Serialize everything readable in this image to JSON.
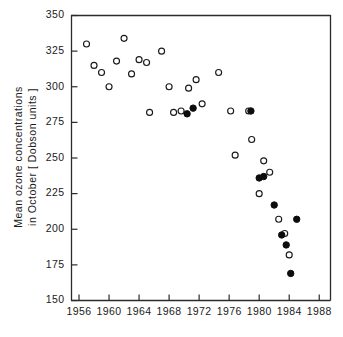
{
  "chart_data": {
    "type": "scatter",
    "title": "",
    "xlabel": "",
    "ylabel": "Mean ozone concentrations in October [ Dobson units ]",
    "ylabel_line1": "Mean ozone concentrations",
    "ylabel_line2": "in October [ Dobson units ]",
    "xlim": [
      1955,
      1989.5
    ],
    "ylim": [
      150,
      350
    ],
    "xticks": [
      1956,
      1960,
      1964,
      1968,
      1972,
      1976,
      1980,
      1984,
      1988
    ],
    "xtick_labels": [
      "1956",
      "1960",
      "1964",
      "1968",
      "1972",
      "1976",
      "1980",
      "1984",
      "1988"
    ],
    "yticks": [
      150,
      175,
      200,
      225,
      250,
      275,
      300,
      325,
      350
    ],
    "ytick_labels": [
      "150",
      "175",
      "200",
      "225",
      "250",
      "275",
      "300",
      "325",
      "350"
    ],
    "grid": false,
    "legend": "none",
    "marker_colors": {
      "open": "#ffffff",
      "filled": "#0d0d0d",
      "edge": "#1a1a1a"
    },
    "series": [
      {
        "name": "open-circles",
        "marker": "open-circle",
        "points": [
          {
            "x": 1957,
            "y": 330
          },
          {
            "x": 1958,
            "y": 315
          },
          {
            "x": 1959,
            "y": 310
          },
          {
            "x": 1960,
            "y": 300
          },
          {
            "x": 1961,
            "y": 318
          },
          {
            "x": 1962,
            "y": 334
          },
          {
            "x": 1963,
            "y": 309
          },
          {
            "x": 1964,
            "y": 319
          },
          {
            "x": 1965,
            "y": 317
          },
          {
            "x": 1965.4,
            "y": 282
          },
          {
            "x": 1967,
            "y": 325
          },
          {
            "x": 1968,
            "y": 300
          },
          {
            "x": 1968.6,
            "y": 282
          },
          {
            "x": 1969.6,
            "y": 283
          },
          {
            "x": 1970.6,
            "y": 299
          },
          {
            "x": 1971.6,
            "y": 305
          },
          {
            "x": 1972.4,
            "y": 288
          },
          {
            "x": 1974.6,
            "y": 310
          },
          {
            "x": 1976.2,
            "y": 283
          },
          {
            "x": 1976.8,
            "y": 252
          },
          {
            "x": 1978.6,
            "y": 283
          },
          {
            "x": 1979,
            "y": 263
          },
          {
            "x": 1980,
            "y": 225
          },
          {
            "x": 1980.6,
            "y": 248
          },
          {
            "x": 1981.4,
            "y": 240
          },
          {
            "x": 1982.6,
            "y": 207
          },
          {
            "x": 1983.4,
            "y": 197
          },
          {
            "x": 1984,
            "y": 182
          }
        ]
      },
      {
        "name": "filled-circles",
        "marker": "filled-circle",
        "points": [
          {
            "x": 1970.4,
            "y": 281
          },
          {
            "x": 1971.2,
            "y": 285
          },
          {
            "x": 1978.9,
            "y": 283
          },
          {
            "x": 1980,
            "y": 236
          },
          {
            "x": 1980.6,
            "y": 237
          },
          {
            "x": 1982,
            "y": 217
          },
          {
            "x": 1983,
            "y": 196
          },
          {
            "x": 1983.6,
            "y": 189
          },
          {
            "x": 1984.2,
            "y": 169
          },
          {
            "x": 1985,
            "y": 207
          }
        ]
      }
    ]
  }
}
